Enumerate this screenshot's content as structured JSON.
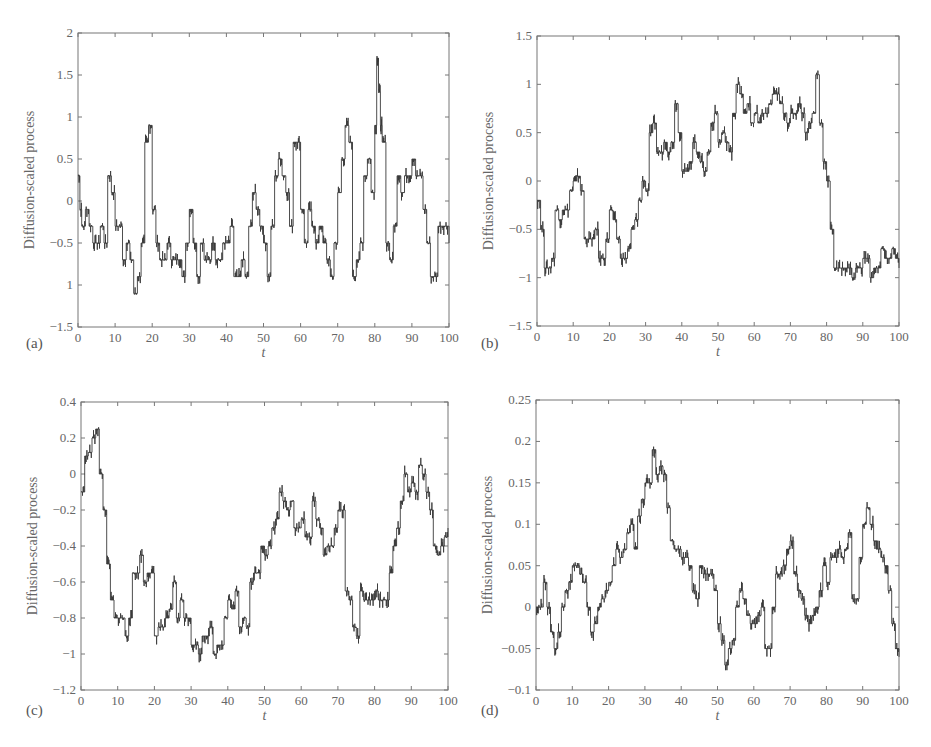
{
  "chart_data": [
    {
      "panel": "(a)",
      "type": "line",
      "title": "",
      "xlabel": "t",
      "ylabel": "Diffusion-scaled process",
      "xlim": [
        0,
        100
      ],
      "ylim": [
        -1.5,
        2
      ],
      "xticks": [
        "0",
        "10",
        "20",
        "30",
        "40",
        "50",
        "60",
        "70",
        "80",
        "90",
        "100"
      ],
      "yticks": [
        "-1.5",
        "1",
        "-0.5",
        "0",
        "0.5",
        "1",
        "1.5",
        "2"
      ],
      "ytick_values": [
        -1.5,
        -1,
        -0.5,
        0,
        0.5,
        1,
        1.5,
        2
      ],
      "grid": false,
      "step": 0.2,
      "x": [
        0,
        0.5,
        1,
        2,
        3,
        4,
        5,
        6,
        7,
        8,
        9,
        10,
        11,
        12,
        13,
        14,
        15,
        16,
        17,
        18,
        19,
        20,
        21,
        22,
        23,
        24,
        25,
        26,
        27,
        28,
        29,
        30,
        31,
        32,
        33,
        34,
        35,
        36,
        37,
        38,
        39,
        40,
        41,
        42,
        43,
        44,
        45,
        46,
        47,
        48,
        49,
        50,
        51,
        52,
        53,
        54,
        55,
        56,
        57,
        58,
        59,
        60,
        61,
        62,
        63,
        64,
        65,
        66,
        67,
        68,
        69,
        70,
        71,
        72,
        73,
        74,
        75,
        76,
        77,
        78,
        79,
        80,
        80.5,
        81,
        81.5,
        82,
        83,
        84,
        85,
        86,
        87,
        88,
        89,
        90,
        91,
        92,
        93,
        94,
        95,
        96,
        97,
        98,
        99,
        100
      ],
      "values": [
        0.3,
        -0.1,
        -0.3,
        -0.1,
        -0.3,
        -0.5,
        -0.5,
        -0.3,
        -0.5,
        0.3,
        0.1,
        -0.3,
        -0.3,
        -0.7,
        -0.5,
        -0.7,
        -1.1,
        -0.9,
        -0.5,
        0.7,
        0.9,
        -0.1,
        -0.5,
        -0.7,
        -0.7,
        -0.5,
        -0.7,
        -0.7,
        -0.7,
        -0.9,
        -0.5,
        -0.1,
        -0.5,
        -0.9,
        -0.5,
        -0.7,
        -0.7,
        -0.5,
        -0.7,
        -0.7,
        -0.5,
        -0.5,
        -0.3,
        -0.9,
        -0.9,
        -0.7,
        -0.9,
        -0.3,
        0.1,
        -0.1,
        -0.3,
        -0.5,
        -0.9,
        -0.3,
        0.3,
        0.5,
        0.3,
        0.1,
        -0.3,
        0.7,
        0.7,
        -0.1,
        -0.5,
        -0.1,
        -0.3,
        -0.5,
        -0.3,
        -0.5,
        -0.7,
        -0.9,
        -0.5,
        0.1,
        0.5,
        0.9,
        0.7,
        -0.9,
        -0.7,
        -0.5,
        0.3,
        0.5,
        0.1,
        0.9,
        1.7,
        1.3,
        0.9,
        0.7,
        -0.5,
        -0.7,
        -0.3,
        0.3,
        0.1,
        0.3,
        0.3,
        0.5,
        0.3,
        0.3,
        -0.1,
        -0.5,
        -0.9,
        -0.9,
        -0.3,
        -0.3,
        -0.3,
        -0.5,
        -0.5
      ]
    },
    {
      "panel": "(b)",
      "type": "line",
      "title": "",
      "xlabel": "t",
      "ylabel": "Diffusion-scaled process",
      "xlim": [
        0,
        100
      ],
      "ylim": [
        -1.5,
        1.5
      ],
      "xticks": [
        "0",
        "10",
        "20",
        "30",
        "40",
        "50",
        "60",
        "70",
        "80",
        "90",
        "100"
      ],
      "yticks": [
        "-1.5",
        "-1",
        "-0.5",
        "0",
        "0.5",
        "1",
        "1.5"
      ],
      "ytick_values": [
        -1.5,
        -1,
        -0.5,
        0,
        0.5,
        1,
        1.5
      ],
      "grid": false,
      "x": [
        0,
        1,
        2,
        3,
        4,
        5,
        6,
        7,
        8,
        9,
        10,
        11,
        12,
        13,
        14,
        15,
        16,
        17,
        18,
        19,
        20,
        21,
        22,
        23,
        24,
        25,
        26,
        27,
        28,
        29,
        30,
        31,
        32,
        33,
        34,
        35,
        36,
        37,
        38,
        39,
        40,
        41,
        42,
        43,
        44,
        45,
        46,
        47,
        48,
        49,
        50,
        51,
        52,
        53,
        54,
        55,
        56,
        57,
        58,
        59,
        60,
        61,
        62,
        63,
        64,
        65,
        66,
        67,
        68,
        69,
        70,
        71,
        72,
        73,
        74,
        75,
        76,
        77,
        78,
        79,
        80,
        81,
        82,
        83,
        84,
        85,
        86,
        87,
        88,
        89,
        90,
        91,
        92,
        93,
        94,
        95,
        96,
        97,
        98,
        99,
        100
      ],
      "values": [
        -0.2,
        -0.5,
        -0.9,
        -0.9,
        -0.8,
        -0.3,
        -0.4,
        -0.3,
        -0.3,
        -0.1,
        0.0,
        0.05,
        -0.1,
        -0.6,
        -0.6,
        -0.6,
        -0.5,
        -0.8,
        -0.8,
        -0.6,
        -0.3,
        -0.4,
        -0.6,
        -0.8,
        -0.8,
        -0.7,
        -0.5,
        -0.4,
        -0.2,
        0.0,
        -0.1,
        0.5,
        0.6,
        0.3,
        0.3,
        0.4,
        0.3,
        0.4,
        0.8,
        0.5,
        0.1,
        0.1,
        0.2,
        0.4,
        0.3,
        0.2,
        0.1,
        0.3,
        0.6,
        0.7,
        0.4,
        0.5,
        0.4,
        0.3,
        0.7,
        1.0,
        0.9,
        0.7,
        0.8,
        0.6,
        0.7,
        0.6,
        0.7,
        0.7,
        0.8,
        0.9,
        0.9,
        0.8,
        0.7,
        0.6,
        0.7,
        0.7,
        0.8,
        0.7,
        0.5,
        0.6,
        0.7,
        1.1,
        0.6,
        0.2,
        0.0,
        -0.5,
        -0.9,
        -0.9,
        -0.9,
        -0.9,
        -0.9,
        -1.0,
        -0.9,
        -0.9,
        -0.8,
        -0.8,
        -1.0,
        -0.9,
        -0.9,
        -0.7,
        -0.8,
        -0.8,
        -0.7,
        -0.8,
        -0.9
      ]
    },
    {
      "panel": "(c)",
      "type": "line",
      "title": "",
      "xlabel": "t",
      "ylabel": "Diffusion-scaled process",
      "xlim": [
        0,
        100
      ],
      "ylim": [
        -1.2,
        0.4
      ],
      "xticks": [
        "0",
        "10",
        "20",
        "30",
        "40",
        "50",
        "60",
        "70",
        "80",
        "90",
        "100"
      ],
      "yticks": [
        "-1.2",
        "-1",
        "-0.8",
        "-0.6",
        "-0.4",
        "-0.2",
        "0",
        "0.2",
        "0.4"
      ],
      "ytick_values": [
        -1.2,
        -1,
        -0.8,
        -0.6,
        -0.4,
        -0.2,
        0,
        0.2,
        0.4
      ],
      "grid": false,
      "x": [
        0,
        1,
        2,
        3,
        4,
        5,
        6,
        7,
        8,
        9,
        10,
        11,
        12,
        13,
        14,
        15,
        16,
        17,
        18,
        19,
        20,
        21,
        22,
        23,
        24,
        25,
        26,
        27,
        28,
        29,
        30,
        31,
        32,
        33,
        34,
        35,
        36,
        37,
        38,
        39,
        40,
        41,
        42,
        43,
        44,
        45,
        46,
        47,
        48,
        49,
        50,
        51,
        52,
        53,
        54,
        55,
        56,
        57,
        58,
        59,
        60,
        61,
        62,
        63,
        64,
        65,
        66,
        67,
        68,
        69,
        70,
        71,
        72,
        73,
        74,
        75,
        76,
        77,
        78,
        79,
        80,
        81,
        82,
        83,
        84,
        85,
        86,
        87,
        88,
        89,
        90,
        91,
        92,
        93,
        94,
        95,
        96,
        97,
        98,
        99,
        100
      ],
      "values": [
        -0.1,
        0.1,
        0.12,
        0.2,
        0.25,
        0.0,
        -0.2,
        -0.5,
        -0.7,
        -0.8,
        -0.8,
        -0.8,
        -0.9,
        -0.8,
        -0.55,
        -0.55,
        -0.45,
        -0.6,
        -0.55,
        -0.55,
        -0.9,
        -0.85,
        -0.85,
        -0.8,
        -0.75,
        -0.6,
        -0.8,
        -0.7,
        -0.8,
        -0.8,
        -0.95,
        -0.95,
        -1.0,
        -0.9,
        -0.9,
        -0.85,
        -1.0,
        -0.95,
        -0.95,
        -0.8,
        -0.7,
        -0.75,
        -0.65,
        -0.85,
        -0.8,
        -0.85,
        -0.6,
        -0.55,
        -0.55,
        -0.4,
        -0.45,
        -0.4,
        -0.3,
        -0.25,
        -0.1,
        -0.15,
        -0.2,
        -0.15,
        -0.3,
        -0.3,
        -0.25,
        -0.35,
        -0.35,
        -0.15,
        -0.25,
        -0.3,
        -0.45,
        -0.4,
        -0.4,
        -0.3,
        -0.2,
        -0.2,
        -0.65,
        -0.7,
        -0.85,
        -0.9,
        -0.65,
        -0.7,
        -0.7,
        -0.7,
        -0.65,
        -0.7,
        -0.7,
        -0.7,
        -0.55,
        -0.4,
        -0.3,
        -0.15,
        0.0,
        -0.1,
        -0.05,
        -0.1,
        0.05,
        0.0,
        -0.1,
        -0.2,
        -0.4,
        -0.45,
        -0.4,
        -0.35,
        -0.3
      ]
    },
    {
      "panel": "(d)",
      "type": "line",
      "title": "",
      "xlabel": "t",
      "ylabel": "Diffusion-scaled process",
      "xlim": [
        0,
        100
      ],
      "ylim": [
        -0.1,
        0.25
      ],
      "xticks": [
        "0",
        "10",
        "20",
        "30",
        "40",
        "50",
        "60",
        "70",
        "80",
        "90",
        "100"
      ],
      "yticks": [
        "-0.1",
        "-0.05",
        "0",
        "0.05",
        "0.1",
        "0.15",
        "0.2",
        "0.25"
      ],
      "ytick_values": [
        -0.1,
        -0.05,
        0,
        0.05,
        0.1,
        0.15,
        0.2,
        0.25
      ],
      "grid": false,
      "x": [
        0,
        1,
        2,
        3,
        4,
        5,
        6,
        7,
        8,
        9,
        10,
        11,
        12,
        13,
        14,
        15,
        16,
        17,
        18,
        19,
        20,
        21,
        22,
        23,
        24,
        25,
        26,
        27,
        28,
        29,
        30,
        31,
        32,
        33,
        34,
        35,
        36,
        37,
        38,
        39,
        40,
        41,
        42,
        43,
        44,
        45,
        46,
        47,
        48,
        49,
        50,
        51,
        52,
        53,
        54,
        55,
        56,
        57,
        58,
        59,
        60,
        61,
        62,
        63,
        64,
        65,
        66,
        67,
        68,
        69,
        70,
        71,
        72,
        73,
        74,
        75,
        76,
        77,
        78,
        79,
        80,
        81,
        82,
        83,
        84,
        85,
        86,
        87,
        88,
        89,
        90,
        91,
        92,
        93,
        94,
        95,
        96,
        97,
        98,
        99,
        100
      ],
      "values": [
        0.0,
        0.0,
        0.03,
        0.0,
        -0.03,
        -0.05,
        -0.03,
        0.0,
        0.02,
        0.03,
        0.05,
        0.05,
        0.04,
        0.03,
        0.0,
        -0.03,
        -0.02,
        0.0,
        0.01,
        0.02,
        0.03,
        0.05,
        0.07,
        0.06,
        0.07,
        0.09,
        0.1,
        0.07,
        0.11,
        0.13,
        0.15,
        0.15,
        0.19,
        0.16,
        0.17,
        0.16,
        0.12,
        0.08,
        0.07,
        0.07,
        0.06,
        0.06,
        0.05,
        0.02,
        0.01,
        0.05,
        0.04,
        0.04,
        0.04,
        0.02,
        -0.02,
        -0.04,
        -0.07,
        -0.05,
        -0.04,
        0.0,
        0.02,
        0.01,
        -0.01,
        -0.02,
        -0.02,
        -0.01,
        0.0,
        -0.05,
        -0.05,
        0.0,
        0.04,
        0.04,
        0.05,
        0.07,
        0.08,
        0.04,
        0.02,
        0.01,
        -0.01,
        -0.02,
        -0.01,
        0.0,
        0.02,
        0.05,
        0.03,
        0.06,
        0.06,
        0.07,
        0.06,
        0.07,
        0.09,
        0.01,
        0.01,
        0.06,
        0.1,
        0.12,
        0.1,
        0.08,
        0.07,
        0.06,
        0.05,
        0.02,
        -0.02,
        -0.05,
        -0.06
      ]
    }
  ],
  "panels": {
    "a": {
      "letter": "(a)",
      "xlabel": "t",
      "ylabel": "Diffusion-scaled process"
    },
    "b": {
      "letter": "(b)",
      "xlabel": "t",
      "ylabel": "Diffusion-scaled process"
    },
    "c": {
      "letter": "(c)",
      "xlabel": "t",
      "ylabel": "Diffusion-scaled process"
    },
    "d": {
      "letter": "(d)",
      "xlabel": "t",
      "ylabel": "Diffusion-scaled process"
    }
  }
}
